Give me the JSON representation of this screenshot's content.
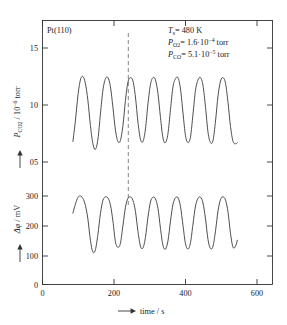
{
  "figure": {
    "sample_label": "Pt(110)",
    "annotations": [
      {
        "id": "temperature",
        "symbol": "T",
        "symbol_sub": "s",
        "value": "= 480 K"
      },
      {
        "id": "oxygen-pressure",
        "symbol": "P",
        "symbol_sub": "O2",
        "value": "= 1.6·10",
        "exponent": "−4",
        "unit": " torr"
      },
      {
        "id": "co-pressure",
        "symbol": "P",
        "symbol_sub": "CO",
        "value": "= 5.1·10",
        "exponent": "−5",
        "unit": " torr"
      }
    ],
    "marker_line": {
      "label": "phase-correlation-line",
      "time": 240
    }
  },
  "chart_data": {
    "type": "line",
    "title": "",
    "xlabel": "time / s",
    "xlabel_prefix_arrow": "⟶",
    "xlim": [
      0,
      680
    ],
    "xticks": [
      0,
      200,
      400,
      600
    ],
    "xticklabels": [
      "0",
      "200",
      "400",
      "600"
    ],
    "grid": false,
    "legend": "none",
    "panels": [
      {
        "id": "co2-partial-pressure",
        "ylabel": "P_CO2 / 10^-6 torr",
        "ylabel_symbol": "P",
        "ylabel_sub": "CO",
        "ylabel_sub2": "2",
        "ylabel_rest": " / 10",
        "ylabel_exp": "−6",
        "ylabel_unit": " torr",
        "ylim": [
          3.0,
          17.2
        ],
        "yticks": [
          5,
          10,
          15
        ],
        "yticklabels": [
          "05",
          "10",
          "15"
        ],
        "series": [
          {
            "name": "P_CO2",
            "units": "10^-6 torr",
            "x": [
              85,
              92,
              99,
              106,
              113,
              120,
              127,
              134,
              141,
              148,
              155,
              162,
              169,
              176,
              183,
              190,
              197,
              204,
              211,
              218,
              225,
              232,
              239,
              246,
              253,
              260,
              267,
              274,
              281,
              288,
              295,
              302,
              309,
              316,
              323,
              330,
              337,
              344,
              351,
              358,
              365,
              372,
              379,
              386,
              393,
              400,
              407,
              414,
              421,
              428,
              435,
              442,
              449,
              456,
              463,
              470,
              477,
              484,
              491,
              498,
              505,
              512,
              519,
              526,
              533,
              540,
              545
            ],
            "y": [
              6.8,
              8.6,
              10.8,
              12.2,
              12.5,
              11.9,
              10.4,
              8.2,
              6.6,
              6.1,
              7.0,
              9.2,
              11.3,
              12.3,
              12.4,
              11.6,
              9.8,
              7.8,
              6.8,
              6.9,
              8.2,
              10.4,
              12.0,
              12.4,
              12.1,
              10.7,
              8.5,
              7.0,
              6.8,
              7.9,
              10.1,
              11.8,
              12.4,
              12.2,
              11.0,
              8.9,
              7.1,
              6.7,
              7.5,
              9.6,
              11.6,
              12.3,
              12.4,
              11.4,
              9.3,
              7.3,
              6.7,
              7.2,
              9.2,
              11.3,
              12.2,
              12.4,
              11.7,
              9.8,
              7.6,
              6.7,
              6.9,
              8.6,
              10.8,
              12.1,
              12.4,
              11.9,
              10.2,
              8.1,
              6.8,
              6.6,
              6.7
            ]
          }
        ]
      },
      {
        "id": "work-function-change",
        "ylabel": "Δφ / mV",
        "ylabel_symbol": "Δφ",
        "ylabel_rest": " / mV",
        "ylim": [
          0,
          340
        ],
        "yticks": [
          0,
          100,
          200,
          300
        ],
        "yticklabels": [
          "0",
          "100",
          "200",
          "300"
        ],
        "series": [
          {
            "name": "delta-phi",
            "units": "mV",
            "x": [
              85,
              92,
              99,
              106,
              113,
              120,
              127,
              134,
              141,
              148,
              155,
              162,
              169,
              176,
              183,
              190,
              197,
              204,
              211,
              218,
              225,
              232,
              239,
              246,
              253,
              260,
              267,
              274,
              281,
              288,
              295,
              302,
              309,
              316,
              323,
              330,
              337,
              344,
              351,
              358,
              365,
              372,
              379,
              386,
              393,
              400,
              407,
              414,
              421,
              428,
              435,
              442,
              449,
              456,
              463,
              470,
              477,
              484,
              491,
              498,
              505,
              512,
              519,
              526,
              533,
              540,
              545
            ],
            "y": [
              242,
              272,
              295,
              300,
              292,
              268,
              222,
              150,
              110,
              118,
              170,
              240,
              285,
              297,
              293,
              270,
              215,
              145,
              126,
              140,
              200,
              262,
              292,
              297,
              285,
              248,
              180,
              130,
              124,
              160,
              228,
              280,
              296,
              290,
              258,
              190,
              132,
              120,
              148,
              215,
              272,
              294,
              294,
              264,
              200,
              138,
              120,
              142,
              205,
              266,
              292,
              296,
              276,
              222,
              152,
              122,
              130,
              182,
              250,
              288,
              297,
              286,
              245,
              172,
              126,
              130,
              150
            ]
          }
        ]
      }
    ]
  }
}
